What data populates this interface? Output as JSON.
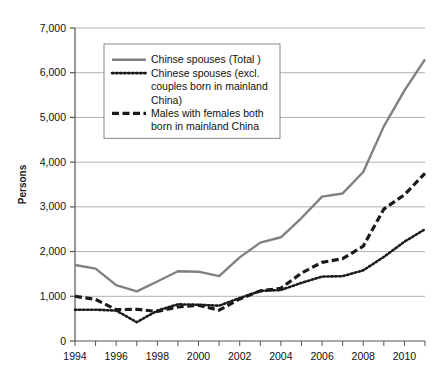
{
  "chart_data": {
    "type": "line",
    "title": "",
    "xlabel": "",
    "ylabel": "Persons",
    "xlim": [
      1994,
      2011
    ],
    "ylim": [
      0,
      7000
    ],
    "grid": true,
    "legend_position": "top-left-inside",
    "x": [
      1994,
      1995,
      1996,
      1997,
      1998,
      1999,
      2000,
      2001,
      2002,
      2003,
      2004,
      2005,
      2006,
      2007,
      2008,
      2009,
      2010,
      2011
    ],
    "xtick_labels": [
      "1994",
      "1996",
      "1998",
      "2000",
      "2002",
      "2004",
      "2006",
      "2008",
      "2010"
    ],
    "xtick_values": [
      1994,
      1996,
      1998,
      2000,
      2002,
      2004,
      2006,
      2008,
      2010
    ],
    "ytick_labels": [
      "0",
      "1,000",
      "2,000",
      "3,000",
      "4,000",
      "5,000",
      "6,000",
      "7,000"
    ],
    "ytick_values": [
      0,
      1000,
      2000,
      3000,
      4000,
      5000,
      6000,
      7000
    ],
    "series": [
      {
        "name": "Chinse spouses (Total )",
        "style": "solid",
        "color": "#808080",
        "values": [
          1700,
          1620,
          1250,
          1110,
          1330,
          1560,
          1550,
          1450,
          1870,
          2200,
          2320,
          2750,
          3230,
          3300,
          3780,
          4800,
          5600,
          6300
        ]
      },
      {
        "name": "Chinese spouses (excl. couples born in mainland China)",
        "style": "dotted",
        "color": "#1a1a1a",
        "values": [
          700,
          700,
          680,
          420,
          680,
          820,
          810,
          790,
          960,
          1120,
          1140,
          1300,
          1440,
          1450,
          1580,
          1880,
          2220,
          2500
        ]
      },
      {
        "name": "Males with females both born in mainland China",
        "style": "dashed",
        "color": "#1a1a1a",
        "values": [
          1000,
          930,
          700,
          710,
          660,
          760,
          800,
          690,
          940,
          1120,
          1180,
          1520,
          1760,
          1840,
          2120,
          2950,
          3270,
          3750
        ]
      }
    ]
  },
  "legend": {
    "entries": [
      {
        "label_lines": [
          "Chinse spouses (Total )"
        ]
      },
      {
        "label_lines": [
          "Chinese spouses (excl.",
          "couples born in mainland",
          "China)"
        ]
      },
      {
        "label_lines": [
          "Males with females both",
          "born in mainland China"
        ]
      }
    ]
  },
  "colors": {
    "total_line": "#808080",
    "sub_line": "#1a1a1a",
    "grid": "#b0b0b0",
    "axis": "#555555",
    "background": "#ffffff"
  }
}
